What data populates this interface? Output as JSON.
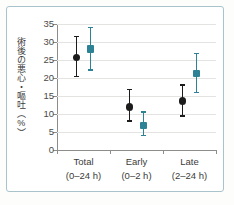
{
  "figure": {
    "frame_color": "#a9c3cc",
    "background": "#ffffff"
  },
  "chart_data": {
    "type": "scatter",
    "title": "",
    "subtitle": "",
    "xlabel": "",
    "ylabel": "術後の悪心・嘔吐（%）",
    "ylim": [
      0,
      35
    ],
    "yticks": [
      0,
      5,
      10,
      15,
      20,
      25,
      30,
      35
    ],
    "ytick_labels": [
      "0",
      "5",
      "10",
      "15",
      "20",
      "25",
      "30",
      "35"
    ],
    "grid": true,
    "grid_axis": "y",
    "legend": "none",
    "error_bars": "vertical, with caps (95% CI)",
    "categories": [
      "Total",
      "Early",
      "Late"
    ],
    "category_sublabels": [
      "(0–24 h)",
      "(0–2 h)",
      "(2–24 h)"
    ],
    "series": [
      {
        "name": "black",
        "color": "#1c1c1c",
        "marker": "circle",
        "values": [
          25.7,
          12.0,
          13.6
        ],
        "ci_low": [
          20.6,
          8.2,
          9.6
        ],
        "ci_high": [
          31.7,
          17.0,
          18.2
        ]
      },
      {
        "name": "teal",
        "color": "#2d8296",
        "marker": "square",
        "values": [
          28.0,
          6.8,
          21.3
        ],
        "ci_low": [
          22.4,
          4.1,
          16.2
        ],
        "ci_high": [
          34.2,
          10.7,
          27.0
        ]
      }
    ]
  },
  "axis": {
    "y_tick_0": "0",
    "y_tick_1": "5",
    "y_tick_2": "10",
    "y_tick_3": "15",
    "y_tick_4": "20",
    "y_tick_5": "25",
    "y_tick_6": "30",
    "y_tick_7": "35",
    "y_title": "術後の悪心・嘔吐（%）"
  },
  "xlabels": [
    {
      "name": "Total",
      "range": "(0–24 h)"
    },
    {
      "name": "Early",
      "range": "(0–2 h)"
    },
    {
      "name": "Late",
      "range": "(2–24 h)"
    }
  ]
}
